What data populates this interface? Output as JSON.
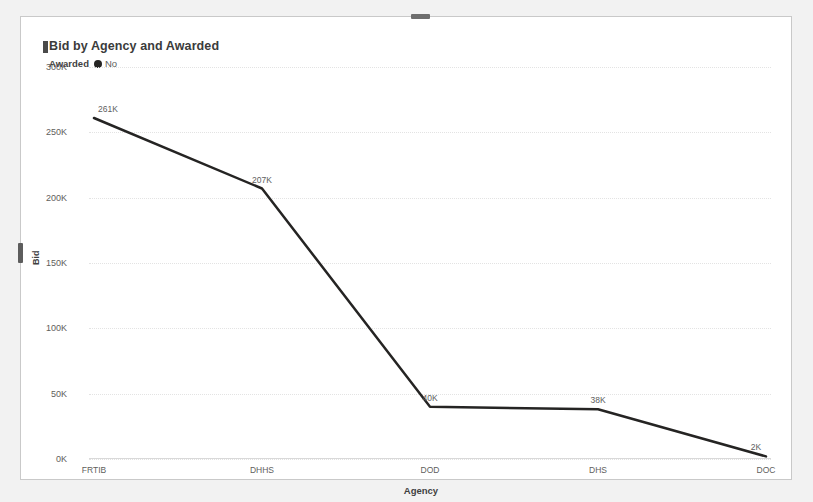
{
  "card": {
    "title": "Bid by Agency and Awarded"
  },
  "legend": {
    "title": "Awarded",
    "marker_icon": "filled-circle-icon",
    "items": [
      {
        "label": "No",
        "color": "#252423"
      }
    ]
  },
  "handles": {
    "top_handle_name": "top-resize-handle",
    "left_handle_name": "left-resize-handle"
  },
  "chart_data": {
    "type": "line",
    "title": "Bid by Agency and Awarded",
    "xlabel": "Agency",
    "ylabel": "Bid",
    "categories": [
      "FRTIB",
      "DHHS",
      "DOD",
      "DHS",
      "DOC"
    ],
    "series": [
      {
        "name": "No",
        "color": "#252423",
        "values": [
          261000,
          207000,
          40000,
          38000,
          2000
        ],
        "data_labels": [
          "261K",
          "207K",
          "40K",
          "38K",
          "2K"
        ]
      }
    ],
    "ylim": [
      0,
      300000
    ],
    "yticks": [
      0,
      50000,
      100000,
      150000,
      200000,
      250000,
      300000
    ],
    "ytick_labels": [
      "0K",
      "50K",
      "100K",
      "150K",
      "200K",
      "250K",
      "300K"
    ],
    "grid": true,
    "grid_axis": "y",
    "legend_position": "top-left",
    "line_width": 2.5,
    "markers": false
  }
}
